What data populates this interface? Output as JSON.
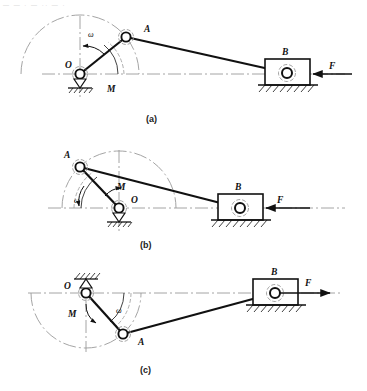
{
  "figure": {
    "title_artifact": "— —  · —  ·· — ·",
    "background_color": "#ffffff",
    "line_color": "#111111",
    "centerline_color": "#9a9a9a",
    "panels": [
      {
        "id": "a",
        "caption": "(a)",
        "labels": {
          "pivot": "O",
          "crank_pin": "A",
          "slider": "B",
          "force": "F",
          "moment": "M",
          "omega": "ω"
        },
        "geometry": {
          "pivot": [
            80,
            74
          ],
          "crank_pin": [
            126,
            37
          ],
          "slider_pin": [
            287,
            73
          ],
          "crank_radius": 59,
          "force_direction": "left",
          "rotation_direction": "counterclockwise"
        }
      },
      {
        "id": "b",
        "caption": "(b)",
        "labels": {
          "pivot": "O",
          "crank_pin": "A",
          "slider": "B",
          "force": "F",
          "moment": "M",
          "omega": "ω"
        },
        "geometry": {
          "pivot": [
            119,
            208
          ],
          "crank_pin": [
            80,
            167
          ],
          "slider_pin": [
            240,
            208
          ],
          "crank_radius": 57,
          "force_direction": "left",
          "rotation_direction": "counterclockwise"
        }
      },
      {
        "id": "c",
        "caption": "(c)",
        "labels": {
          "pivot": "O",
          "crank_pin": "A",
          "slider": "B",
          "force": "F",
          "moment": "M",
          "omega": "ω"
        },
        "geometry": {
          "pivot": [
            86,
            293
          ],
          "crank_pin": [
            123,
            334
          ],
          "slider_pin": [
            275,
            293
          ],
          "crank_radius": 55,
          "force_direction": "right",
          "rotation_direction": "clockwise"
        }
      }
    ]
  }
}
